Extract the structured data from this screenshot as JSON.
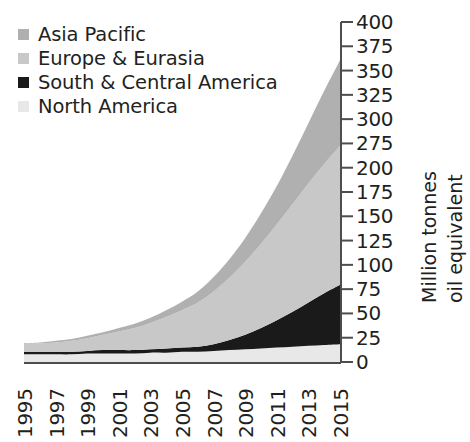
{
  "legend": {
    "position": "top-left",
    "items": [
      {
        "label": "Asia Pacific",
        "color": "#b0b0b0"
      },
      {
        "label": "Europe & Eurasia",
        "color": "#c8c8c8"
      },
      {
        "label": "South & Central America",
        "color": "#1a1a1a"
      },
      {
        "label": "North America",
        "color": "#e8e8e8"
      }
    ]
  },
  "axes": {
    "y_title_lines": [
      "Million tonnes",
      "oil equivalent"
    ],
    "y_tick_labels": [
      "400",
      "375",
      "350",
      "325",
      "300",
      "275",
      "200",
      "175",
      "150",
      "125",
      "100",
      "75",
      "50",
      "25",
      "0"
    ],
    "x_tick_labels": [
      "1995",
      "1997",
      "1999",
      "2001",
      "2003",
      "2005",
      "2007",
      "2009",
      "2011",
      "2013",
      "2015"
    ]
  },
  "chart_data": {
    "type": "area",
    "stacked": true,
    "title": "",
    "xlabel": "",
    "ylabel": "Million tonnes oil equivalent",
    "ylim": [
      0,
      400
    ],
    "xlim": [
      1995,
      2015
    ],
    "grid": false,
    "legend_position": "top-left",
    "y_tick_values": [
      0,
      25,
      50,
      75,
      100,
      125,
      150,
      175,
      200,
      275,
      300,
      325,
      350,
      375,
      400
    ],
    "x": [
      1995,
      1996,
      1997,
      1998,
      1999,
      2000,
      2001,
      2002,
      2003,
      2004,
      2005,
      2006,
      2007,
      2008,
      2009,
      2010,
      2011,
      2012,
      2013,
      2014,
      2015
    ],
    "stack_order_bottom_to_top": [
      "North America",
      "South & Central America",
      "Europe & Eurasia",
      "Asia Pacific"
    ],
    "series": [
      {
        "name": "North America",
        "color": "#e8e8e8",
        "values": [
          9,
          9,
          9,
          9,
          10,
          10,
          10,
          10,
          11,
          11,
          12,
          12,
          13,
          14,
          15,
          16,
          17,
          18,
          19,
          20,
          21
        ]
      },
      {
        "name": "South & Central America",
        "color": "#1a1a1a",
        "values": [
          3,
          3,
          3,
          3,
          3,
          4,
          4,
          4,
          4,
          5,
          5,
          6,
          8,
          12,
          17,
          24,
          32,
          41,
          51,
          61,
          70
        ]
      },
      {
        "name": "Europe & Eurasia",
        "color": "#c8c8c8",
        "values": [
          9,
          10,
          11,
          13,
          15,
          18,
          22,
          26,
          31,
          37,
          44,
          52,
          62,
          73,
          86,
          99,
          113,
          127,
          140,
          152,
          163
        ]
      },
      {
        "name": "Asia Pacific",
        "color": "#b0b0b0",
        "values": [
          1,
          1,
          2,
          2,
          3,
          3,
          4,
          5,
          6,
          8,
          10,
          13,
          17,
          22,
          28,
          36,
          45,
          57,
          71,
          86,
          101
        ]
      }
    ],
    "totals": [
      22,
      23,
      25,
      27,
      31,
      35,
      40,
      45,
      52,
      61,
      71,
      83,
      100,
      121,
      146,
      175,
      207,
      243,
      281,
      319,
      355
    ]
  }
}
